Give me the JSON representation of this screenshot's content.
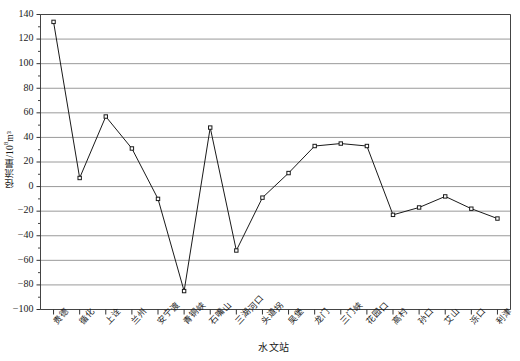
{
  "chart_data": {
    "type": "line",
    "title": "",
    "xlabel": "水文站",
    "ylabel": "径流量/10⁸m³",
    "ylabel_base": "径流量/10",
    "ylabel_exp": "8",
    "ylabel_unit": "m³",
    "ylim": [
      -100,
      140
    ],
    "ystep": 20,
    "grid": true,
    "legend": "none",
    "marker": "open-square",
    "line_color": "#1a1a1a",
    "grid_color": "#9a9a9a",
    "axis_color": "#555555",
    "yticks": [
      140,
      120,
      100,
      80,
      60,
      40,
      20,
      0,
      -20,
      -40,
      -60,
      -80,
      -100
    ],
    "categories": [
      "贵德",
      "循化",
      "上诠",
      "兰州",
      "安宁渡",
      "青铜峡",
      "石嘴山",
      "三湖河口",
      "头道拐",
      "吴堡",
      "龙门",
      "三门峡",
      "花园口",
      "高村",
      "孙口",
      "艾山",
      "泺口",
      "利津"
    ],
    "values": [
      134,
      7,
      57,
      31,
      -10,
      -85,
      48,
      -52,
      -9,
      11,
      33,
      35,
      33,
      -23,
      -17,
      -8,
      -18,
      -26
    ],
    "series": [
      {
        "name": "径流量",
        "values": [
          134,
          7,
          57,
          31,
          -10,
          -85,
          48,
          -52,
          -9,
          11,
          33,
          35,
          33,
          -23,
          -17,
          -8,
          -18,
          -26
        ]
      }
    ]
  }
}
